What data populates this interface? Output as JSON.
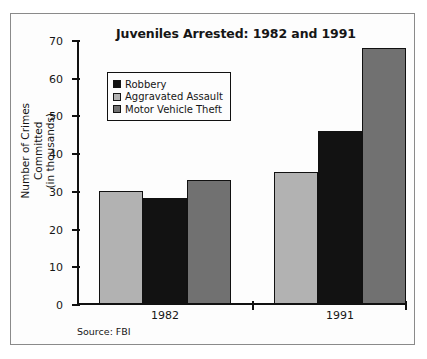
{
  "chart_data": {
    "type": "bar",
    "title": "Juveniles Arrested: 1982 and 1991",
    "xlabel": "",
    "ylabel": "Number of Crimes Committed (in thousands)",
    "ylabel_lines": [
      "Number of Crimes",
      "Committed",
      "(in thousands)"
    ],
    "categories": [
      "1982",
      "1991"
    ],
    "series": [
      {
        "name": "Aggravated Assault",
        "values": [
          30,
          35
        ],
        "color": "#b2b2b2"
      },
      {
        "name": "Robbery",
        "values": [
          28,
          46
        ],
        "color": "#121212"
      },
      {
        "name": "Motor Vehicle Theft",
        "values": [
          33,
          68
        ],
        "color": "#717171"
      }
    ],
    "legend_order": [
      {
        "name": "Robbery",
        "color": "#121212"
      },
      {
        "name": "Aggravated Assault",
        "color": "#b2b2b2"
      },
      {
        "name": "Motor Vehicle Theft",
        "color": "#717171"
      }
    ],
    "ylim": [
      0,
      70
    ],
    "yticks": [
      0,
      10,
      20,
      30,
      40,
      50,
      60,
      70
    ],
    "ytick_labels": [
      "0",
      "10",
      "20",
      "30",
      "40",
      "50",
      "60",
      "70"
    ],
    "grid": false,
    "legend_position": "upper left",
    "source": "Source: FBI"
  },
  "legend": {
    "items": [
      {
        "label": "Robbery"
      },
      {
        "label": "Aggravated Assault"
      },
      {
        "label": "Motor Vehicle Theft"
      }
    ]
  },
  "axis": {
    "y_title_line1": "Number of Crimes",
    "y_title_line2": "Committed",
    "y_title_line3": "(in thousands)"
  },
  "footer": {
    "source": "Source: FBI"
  }
}
